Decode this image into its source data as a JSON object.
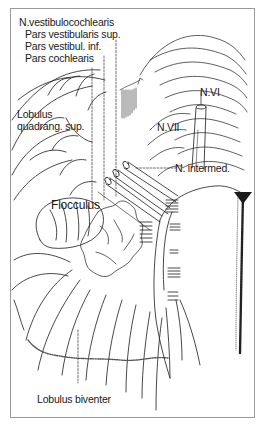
{
  "figure": {
    "type": "anatomical line drawing",
    "colors": {
      "line": "#1a1a1a",
      "frame": "#9a9a9a",
      "background": "#ffffff",
      "stipple": "#555555"
    }
  },
  "labels": {
    "n_vestibulocochlearis": "N.vestibulocochlearis",
    "pars_vestibularis_sup": "Pars vestibularis sup.",
    "pars_vestibul_inf": "Pars vestibul. inf.",
    "pars_cochlearis": "Pars cochlearis",
    "lobulus_quadrang_sup_1": "Lobulus",
    "lobulus_quadrang_sup_2": "quadrang. sup.",
    "n_vi": "N.VI",
    "n_vii": "N.VII",
    "n_intermed": "N. intermed.",
    "flocculus": "Flocculus",
    "lobulus_biventer": "Lobulus biventer"
  }
}
